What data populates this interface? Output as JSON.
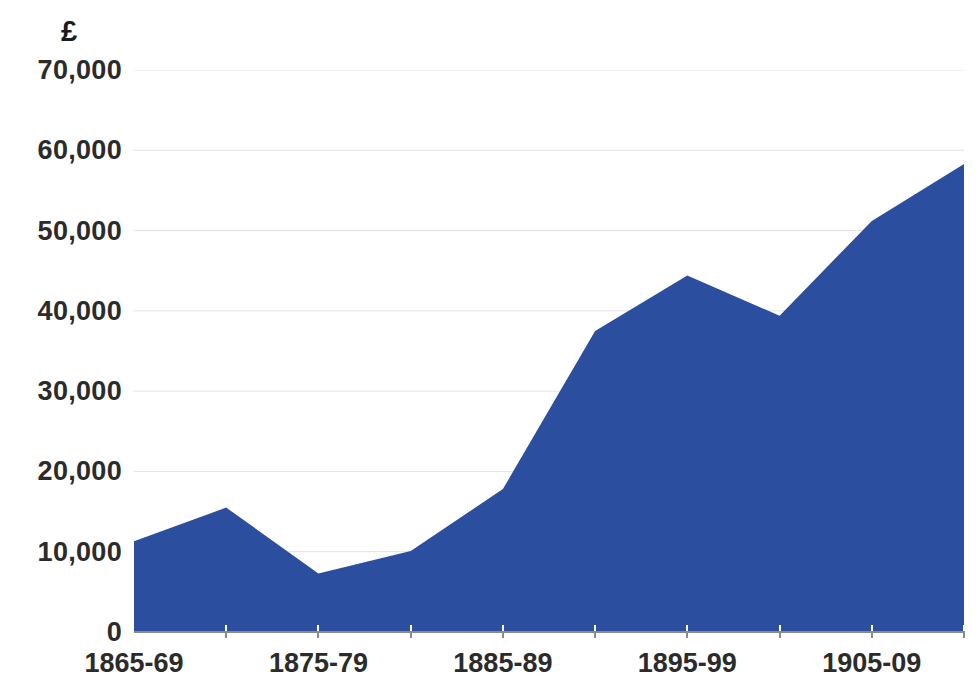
{
  "chart_data": {
    "type": "area",
    "title": "",
    "subtitle": "",
    "xlabel": "",
    "ylabel": "£",
    "y_unit_symbol": "£",
    "categories": [
      "1865-69",
      "1870-74",
      "1875-79",
      "1880-84",
      "1885-89",
      "1890-94",
      "1895-99",
      "1900-04",
      "1905-09",
      "1910-14"
    ],
    "x_tick_labels_shown": [
      "1865-69",
      "1875-79",
      "1885-89",
      "1895-99",
      "1905-09"
    ],
    "values": [
      11300,
      15500,
      7300,
      10100,
      17800,
      37500,
      44400,
      39400,
      51200,
      58300
    ],
    "series": [
      {
        "name": "£",
        "values": [
          11300,
          15500,
          7300,
          10100,
          17800,
          37500,
          44400,
          39400,
          51200,
          58300
        ]
      }
    ],
    "ylim": [
      0,
      70000
    ],
    "y_ticks": [
      0,
      10000,
      20000,
      30000,
      40000,
      50000,
      60000,
      70000
    ],
    "y_tick_labels": [
      "0",
      "10,000",
      "20,000",
      "30,000",
      "40,000",
      "50,000",
      "60,000",
      "70,000"
    ],
    "grid": true,
    "grid_axis": "y",
    "legend": false,
    "legend_position": "none",
    "colors": {
      "area_fill": "#2b4f9e",
      "grid_line": "#e3e3e3",
      "axis_line": "#8b8b8b",
      "text": "#2b2b2b",
      "background": "#ffffff"
    }
  }
}
